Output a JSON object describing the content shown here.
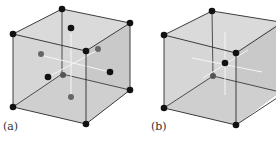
{
  "figures": [
    {
      "label": "(a)",
      "lattice": "face-centered cubic"
    },
    {
      "label": "(b)",
      "lattice": "body-centered cubic"
    }
  ],
  "colors": {
    "face_fill": "#d4d4d4",
    "edge": "#2a2a2a",
    "atom": "#111111",
    "hidden_atom": "#555555",
    "axis_line": "#f5f5f5"
  }
}
